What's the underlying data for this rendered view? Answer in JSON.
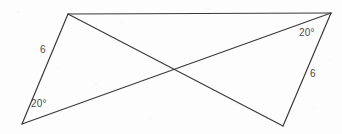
{
  "figure": {
    "background_color": "#fdfdfd",
    "stroke_color": "#3a3a3a",
    "text_color": "#4a4a4a",
    "stroke_width": 1.2,
    "width": 342,
    "height": 134
  },
  "vertices": {
    "left_apex": {
      "name": "left-apex",
      "x": 68,
      "y": 14
    },
    "left_bottom": {
      "name": "left-bottom",
      "x": 22,
      "y": 124
    },
    "crossing": {
      "name": "crossing-point",
      "x": 172,
      "y": 70
    },
    "right_bottom": {
      "name": "right-bottom",
      "x": 283,
      "y": 126
    },
    "right_apex": {
      "name": "right-apex",
      "x": 331,
      "y": 13
    }
  },
  "segments": [
    {
      "name": "left-side-6",
      "from": "left_apex",
      "to": "left_bottom",
      "x1": 68,
      "y1": 14,
      "x2": 22,
      "y2": 124
    },
    {
      "name": "upper-transversal",
      "from": "left_apex",
      "to": "right_apex",
      "x1": 68,
      "y1": 14,
      "x2": 331,
      "y2": 13
    },
    {
      "name": "lower-transversal",
      "from": "left_bottom",
      "to": "right_apex",
      "x1": 22,
      "y1": 124,
      "x2": 331,
      "y2": 13
    },
    {
      "name": "right-side-6",
      "from": "right_apex",
      "to": "right_bottom",
      "x1": 331,
      "y1": 13,
      "x2": 283,
      "y2": 126
    },
    {
      "name": "lower-left-to-right-bottom",
      "from": "left_apex",
      "to": "right_bottom",
      "x1": 68,
      "y1": 14,
      "x2": 283,
      "y2": 126
    }
  ],
  "labels": [
    {
      "name": "left-side-length-label",
      "text": "6",
      "x": 40,
      "y": 45
    },
    {
      "name": "left-angle-label",
      "text": "20°",
      "x": 31,
      "y": 99
    },
    {
      "name": "right-angle-label",
      "text": "20°",
      "x": 299,
      "y": 28
    },
    {
      "name": "right-side-length-label",
      "text": "6",
      "x": 310,
      "y": 69
    }
  ],
  "chart_data": {
    "type": "diagram",
    "shape": "bowtie",
    "measurements": [
      {
        "label": "6",
        "kind": "side-length",
        "triangle": "left"
      },
      {
        "label": "20°",
        "kind": "angle",
        "triangle": "left"
      },
      {
        "label": "20°",
        "kind": "angle",
        "triangle": "right"
      },
      {
        "label": "6",
        "kind": "side-length",
        "triangle": "right"
      }
    ]
  }
}
